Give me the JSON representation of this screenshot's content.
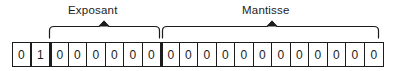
{
  "diagram": {
    "groups": [
      {
        "id": "exposant",
        "label": "Exposant",
        "start_bit": 3,
        "end_bit": 8
      },
      {
        "id": "mantisse",
        "label": "Mantisse",
        "start_bit": 9,
        "end_bit": 20
      }
    ],
    "bits": [
      {
        "index": 1,
        "value": "0"
      },
      {
        "index": 2,
        "value": "1"
      },
      {
        "index": 3,
        "value": "0"
      },
      {
        "index": 4,
        "value": "0"
      },
      {
        "index": 5,
        "value": "0"
      },
      {
        "index": 6,
        "value": "0"
      },
      {
        "index": 7,
        "value": "0"
      },
      {
        "index": 8,
        "value": "0"
      },
      {
        "index": 9,
        "value": "0"
      },
      {
        "index": 10,
        "value": "0"
      },
      {
        "index": 11,
        "value": "0"
      },
      {
        "index": 12,
        "value": "0"
      },
      {
        "index": 13,
        "value": "0"
      },
      {
        "index": 14,
        "value": "0"
      },
      {
        "index": 15,
        "value": "0"
      },
      {
        "index": 16,
        "value": "0"
      },
      {
        "index": 17,
        "value": "0"
      },
      {
        "index": 18,
        "value": "0"
      },
      {
        "index": 19,
        "value": "0"
      },
      {
        "index": 20,
        "value": "0"
      }
    ],
    "colors": {
      "ink": "#1c1c1c",
      "background": "#ffffff"
    }
  }
}
